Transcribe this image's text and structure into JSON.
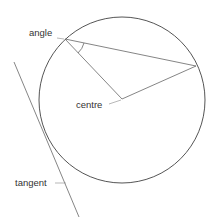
{
  "labels": {
    "angle": "angle",
    "centre": "centre",
    "tangent": "tangent"
  },
  "colors": {
    "line": "#666666",
    "circle": "#555555",
    "text": "#333333"
  },
  "geometry": {
    "circle": {
      "cx": 122,
      "cy": 100,
      "r": 83
    },
    "angle_vertex": [
      65,
      39
    ],
    "chord_end": [
      196,
      66
    ],
    "centre_point": [
      122,
      99
    ],
    "tangent_line": [
      [
        14,
        62
      ],
      [
        79,
        217
      ]
    ]
  }
}
